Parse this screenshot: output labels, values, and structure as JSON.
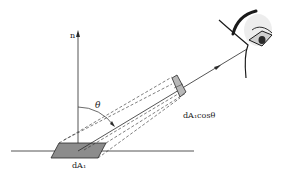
{
  "diagram": {
    "normal_label": "n",
    "angle_label": "θ",
    "source_area_label": "dA₁",
    "projected_area_label": "dA₁cosθ",
    "colors": {
      "line": "#2a2a2a",
      "source_fill": "#8c8c8c",
      "projected_fill": "#b8b8b8",
      "background": "#ffffff"
    }
  }
}
